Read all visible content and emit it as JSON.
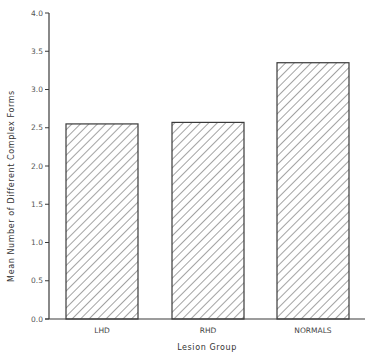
{
  "chart_data": {
    "type": "bar",
    "title": "",
    "xlabel": "Lesion Group",
    "ylabel": "Mean Number of Different Complex Forms",
    "categories": [
      "LHD",
      "RHD",
      "NORMALS"
    ],
    "values": [
      2.55,
      2.57,
      3.35
    ],
    "ylim": [
      0.0,
      4.0
    ],
    "yticks": [
      "0.0",
      "0.5",
      "1.0",
      "1.5",
      "2.0",
      "2.5",
      "3.0",
      "3.5",
      "4.0"
    ],
    "grid": false,
    "legend": null,
    "bar_fill": "diagonal-hatch",
    "colors": {
      "bar_stroke": "#3a3a3a",
      "hatch": "#555555",
      "axis": "#3a3a3a"
    }
  }
}
